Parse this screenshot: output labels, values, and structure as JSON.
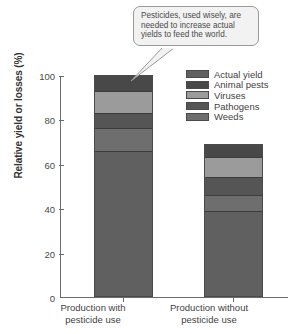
{
  "chart_data": {
    "type": "bar",
    "subtype": "stacked-bar",
    "title": "",
    "xlabel": "",
    "ylabel": "Relative yield or losses (%)",
    "ylim": [
      0,
      100
    ],
    "yticks": [
      0,
      20,
      40,
      60,
      80,
      100
    ],
    "grid": false,
    "legend_position": "top-right",
    "categories": [
      "Production with pesticide use",
      "Production without pesticide use"
    ],
    "series": [
      {
        "name": "Actual yield",
        "values": [
          65,
          38
        ],
        "color": "#606060"
      },
      {
        "name": "Weeds",
        "values": [
          10,
          7
        ],
        "color": "#6e6e6e"
      },
      {
        "name": "Pathogens",
        "values": [
          7,
          8
        ],
        "color": "#555555"
      },
      {
        "name": "Viruses",
        "values": [
          10,
          9
        ],
        "color": "#9b9b9b"
      },
      {
        "name": "Animal pests",
        "values": [
          7,
          6
        ],
        "color": "#484848"
      }
    ],
    "totals": [
      99,
      68
    ],
    "annotations": [
      {
        "type": "callout",
        "text": "Pesticides, used wisely, are needed to increase actual yields to feed the world.",
        "points_to": "Production with pesticide use bar"
      }
    ]
  },
  "axis": {
    "y_title": "Relative yield or losses (%)",
    "y_tick_labels": [
      "0",
      "20",
      "40",
      "60",
      "80",
      "100"
    ]
  },
  "legend": {
    "items": [
      {
        "label": "Actual yield",
        "swatch": "#606060"
      },
      {
        "label": "Animal pests",
        "swatch": "#484848"
      },
      {
        "label": "Viruses",
        "swatch": "#9b9b9b"
      },
      {
        "label": "Pathogens",
        "swatch": "#555555"
      },
      {
        "label": "Weeds",
        "swatch": "#6e6e6e"
      }
    ]
  },
  "x_labels": [
    {
      "line1": "Production with",
      "line2": "pesticide use"
    },
    {
      "line1": "Production without",
      "line2": "pesticide use"
    }
  ],
  "callout": {
    "text": "Pesticides, used wisely, are needed to increase actual yields to feed the world."
  }
}
